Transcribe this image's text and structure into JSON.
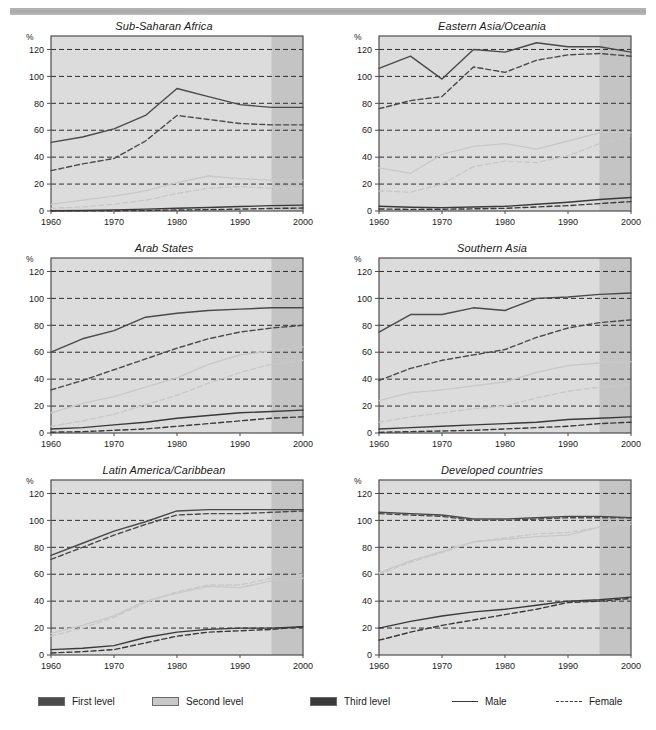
{
  "figure": {
    "y_axis_unit": "%",
    "y_ticks": [
      0,
      20,
      40,
      60,
      80,
      100,
      120
    ],
    "x_ticks": [
      1960,
      1970,
      1980,
      1990,
      2000
    ],
    "x_range": [
      1960,
      2000
    ],
    "y_range": [
      0,
      130
    ],
    "projection_start": 1995
  },
  "colors": {
    "first_level": "#4a4a4a",
    "second_level": "#c8c8c8",
    "third_level": "#3a3a3a",
    "plot_background": "#dcdcdc",
    "projection_background": "#c4c4c4",
    "gridline": "#2d2d2d",
    "axis": "#4d4d4d",
    "top_rule": "#b0b0b0"
  },
  "legend": {
    "items": [
      {
        "label": "First level",
        "type": "swatch",
        "color": "#4a4a4a"
      },
      {
        "label": "Second level",
        "type": "swatch",
        "color": "#c8c8c8"
      },
      {
        "label": "Third level",
        "type": "swatch",
        "color": "#3a3a3a"
      },
      {
        "label": "Male",
        "type": "line-solid"
      },
      {
        "label": "Female",
        "type": "line-dashed"
      }
    ]
  },
  "chart_data": [
    {
      "type": "line",
      "title": "Sub-Saharan Africa",
      "xlabel": "",
      "ylabel": "%",
      "xlim": [
        1960,
        2000
      ],
      "ylim": [
        0,
        130
      ],
      "xticks": [
        1960,
        1970,
        1980,
        1990,
        2000
      ],
      "yticks": [
        0,
        20,
        40,
        60,
        80,
        100,
        120
      ],
      "grid": true,
      "legend_position": "figure-bottom",
      "x": [
        1960,
        1965,
        1970,
        1975,
        1980,
        1985,
        1990,
        1995,
        2000
      ],
      "series": [
        {
          "name": "First level Male",
          "level": "first",
          "sex": "male",
          "style": "solid",
          "values": [
            51,
            55,
            61,
            71,
            91,
            85,
            79,
            77,
            77
          ]
        },
        {
          "name": "First level Female",
          "level": "first",
          "sex": "female",
          "style": "dashed",
          "values": [
            30,
            35,
            39,
            52,
            71,
            68,
            65,
            64,
            64
          ]
        },
        {
          "name": "Second level Male",
          "level": "second",
          "sex": "male",
          "style": "solid",
          "values": [
            5,
            8,
            11,
            15,
            21,
            26,
            24,
            23,
            23
          ]
        },
        {
          "name": "Second level Female",
          "level": "second",
          "sex": "female",
          "style": "dashed",
          "values": [
            2,
            3,
            5,
            8,
            13,
            17,
            18,
            17,
            17
          ]
        },
        {
          "name": "Third level Male",
          "level": "third",
          "sex": "male",
          "style": "solid",
          "values": [
            0.2,
            0.4,
            0.8,
            1.4,
            2.0,
            2.6,
            3.3,
            4.0,
            4.4
          ]
        },
        {
          "name": "Third level Female",
          "level": "third",
          "sex": "female",
          "style": "dashed",
          "values": [
            0.1,
            0.1,
            0.2,
            0.4,
            0.7,
            1.0,
            1.4,
            1.9,
            2.2
          ]
        }
      ]
    },
    {
      "type": "line",
      "title": "Eastern Asia/Oceania",
      "xlabel": "",
      "ylabel": "%",
      "xlim": [
        1960,
        2000
      ],
      "ylim": [
        0,
        130
      ],
      "xticks": [
        1960,
        1970,
        1980,
        1990,
        2000
      ],
      "yticks": [
        0,
        20,
        40,
        60,
        80,
        100,
        120
      ],
      "grid": true,
      "legend_position": "figure-bottom",
      "x": [
        1960,
        1965,
        1970,
        1975,
        1980,
        1985,
        1990,
        1995,
        2000
      ],
      "series": [
        {
          "name": "First level Male",
          "level": "first",
          "sex": "male",
          "style": "solid",
          "values": [
            106,
            115,
            98,
            120,
            118,
            125,
            122,
            122,
            118
          ]
        },
        {
          "name": "First level Female",
          "level": "first",
          "sex": "female",
          "style": "dashed",
          "values": [
            76,
            82,
            85,
            107,
            103,
            112,
            116,
            117,
            115
          ]
        },
        {
          "name": "Second level Male",
          "level": "second",
          "sex": "male",
          "style": "solid",
          "values": [
            32,
            28,
            42,
            48,
            50,
            46,
            52,
            58,
            58
          ]
        },
        {
          "name": "Second level Female",
          "level": "second",
          "sex": "female",
          "style": "dashed",
          "values": [
            15,
            14,
            20,
            33,
            37,
            36,
            41,
            50,
            56
          ]
        },
        {
          "name": "Third level Male",
          "level": "third",
          "sex": "male",
          "style": "solid",
          "values": [
            3.5,
            2.8,
            2.5,
            3.0,
            3.5,
            5.0,
            6.5,
            8.5,
            10.0
          ]
        },
        {
          "name": "Third level Female",
          "level": "third",
          "sex": "female",
          "style": "dashed",
          "values": [
            1.5,
            1.2,
            1.3,
            1.6,
            2.0,
            3.0,
            4.0,
            5.5,
            7.0
          ]
        }
      ]
    },
    {
      "type": "line",
      "title": "Arab States",
      "xlabel": "",
      "ylabel": "%",
      "xlim": [
        1960,
        2000
      ],
      "ylim": [
        0,
        130
      ],
      "xticks": [
        1960,
        1970,
        1980,
        1990,
        2000
      ],
      "yticks": [
        0,
        20,
        40,
        60,
        80,
        100,
        120
      ],
      "grid": true,
      "legend_position": "figure-bottom",
      "x": [
        1960,
        1965,
        1970,
        1975,
        1980,
        1985,
        1990,
        1995,
        2000
      ],
      "series": [
        {
          "name": "First level Male",
          "level": "first",
          "sex": "male",
          "style": "solid",
          "values": [
            60,
            70,
            76,
            86,
            89,
            91,
            92,
            93,
            93
          ]
        },
        {
          "name": "First level Female",
          "level": "first",
          "sex": "female",
          "style": "dashed",
          "values": [
            32,
            39,
            47,
            55,
            63,
            70,
            75,
            78,
            80
          ]
        },
        {
          "name": "Second level Male",
          "level": "second",
          "sex": "male",
          "style": "solid",
          "values": [
            15,
            22,
            27,
            34,
            41,
            51,
            58,
            61,
            64
          ]
        },
        {
          "name": "Second level Female",
          "level": "second",
          "sex": "female",
          "style": "dashed",
          "values": [
            5,
            9,
            14,
            21,
            28,
            37,
            45,
            51,
            54
          ]
        },
        {
          "name": "Third level Male",
          "level": "third",
          "sex": "male",
          "style": "solid",
          "values": [
            3,
            4,
            6,
            8,
            11,
            13,
            15,
            16,
            17
          ]
        },
        {
          "name": "Third level Female",
          "level": "third",
          "sex": "female",
          "style": "dashed",
          "values": [
            0.6,
            1,
            2,
            3,
            5,
            7,
            9,
            11,
            12
          ]
        }
      ]
    },
    {
      "type": "line",
      "title": "Southern Asia",
      "xlabel": "",
      "ylabel": "%",
      "xlim": [
        1960,
        2000
      ],
      "ylim": [
        0,
        130
      ],
      "xticks": [
        1960,
        1970,
        1980,
        1990,
        2000
      ],
      "yticks": [
        0,
        20,
        40,
        60,
        80,
        100,
        120
      ],
      "grid": true,
      "legend_position": "figure-bottom",
      "x": [
        1960,
        1965,
        1970,
        1975,
        1980,
        1985,
        1990,
        1995,
        2000
      ],
      "series": [
        {
          "name": "First level Male",
          "level": "first",
          "sex": "male",
          "style": "solid",
          "values": [
            75,
            88,
            88,
            93,
            91,
            100,
            101,
            103,
            104
          ]
        },
        {
          "name": "First level Female",
          "level": "first",
          "sex": "female",
          "style": "dashed",
          "values": [
            39,
            48,
            54,
            58,
            62,
            71,
            78,
            82,
            84
          ]
        },
        {
          "name": "Second level Male",
          "level": "second",
          "sex": "male",
          "style": "solid",
          "values": [
            24,
            30,
            32,
            35,
            38,
            45,
            50,
            52,
            53
          ]
        },
        {
          "name": "Second level Female",
          "level": "second",
          "sex": "female",
          "style": "dashed",
          "values": [
            8,
            12,
            15,
            18,
            20,
            26,
            31,
            34,
            36
          ]
        },
        {
          "name": "Third level Male",
          "level": "third",
          "sex": "male",
          "style": "solid",
          "values": [
            3,
            4,
            5,
            6,
            7,
            8,
            10,
            11,
            12
          ]
        },
        {
          "name": "Third level Female",
          "level": "third",
          "sex": "female",
          "style": "dashed",
          "values": [
            0.5,
            1,
            1.5,
            2,
            3,
            4,
            5,
            7,
            8
          ]
        }
      ]
    },
    {
      "type": "line",
      "title": "Latin America/Caribbean",
      "xlabel": "",
      "ylabel": "%",
      "xlim": [
        1960,
        2000
      ],
      "ylim": [
        0,
        130
      ],
      "xticks": [
        1960,
        1970,
        1980,
        1990,
        2000
      ],
      "yticks": [
        0,
        20,
        40,
        60,
        80,
        100,
        120
      ],
      "grid": true,
      "legend_position": "figure-bottom",
      "x": [
        1960,
        1965,
        1970,
        1975,
        1980,
        1985,
        1990,
        1995,
        2000
      ],
      "series": [
        {
          "name": "First level Male",
          "level": "first",
          "sex": "male",
          "style": "solid",
          "values": [
            74,
            83,
            92,
            99,
            107,
            108,
            108,
            108,
            108
          ]
        },
        {
          "name": "First level Female",
          "level": "first",
          "sex": "female",
          "style": "dashed",
          "values": [
            71,
            80,
            89,
            97,
            104,
            105,
            105,
            106,
            107
          ]
        },
        {
          "name": "Second level Male",
          "level": "second",
          "sex": "male",
          "style": "solid",
          "values": [
            16,
            22,
            29,
            40,
            46,
            51,
            50,
            55,
            57
          ]
        },
        {
          "name": "Second level Female",
          "level": "second",
          "sex": "female",
          "style": "dashed",
          "values": [
            14,
            20,
            28,
            39,
            47,
            52,
            52,
            57,
            60
          ]
        },
        {
          "name": "Third level Male",
          "level": "third",
          "sex": "male",
          "style": "solid",
          "values": [
            4,
            5,
            7,
            13,
            17,
            19,
            20,
            20,
            21
          ]
        },
        {
          "name": "Third level Female",
          "level": "third",
          "sex": "female",
          "style": "dashed",
          "values": [
            1.5,
            2.5,
            4,
            9,
            14,
            17,
            18,
            19,
            21
          ]
        }
      ]
    },
    {
      "type": "line",
      "title": "Developed countries",
      "xlabel": "",
      "ylabel": "%",
      "xlim": [
        1960,
        2000
      ],
      "ylim": [
        0,
        130
      ],
      "xticks": [
        1960,
        1970,
        1980,
        1990,
        2000
      ],
      "yticks": [
        0,
        20,
        40,
        60,
        80,
        100,
        120
      ],
      "grid": true,
      "legend_position": "figure-bottom",
      "x": [
        1960,
        1965,
        1970,
        1975,
        1980,
        1985,
        1990,
        1995,
        2000
      ],
      "series": [
        {
          "name": "First level Male",
          "level": "first",
          "sex": "male",
          "style": "solid",
          "values": [
            106,
            105,
            104,
            101,
            101,
            102,
            103,
            103,
            102
          ]
        },
        {
          "name": "First level Female",
          "level": "first",
          "sex": "female",
          "style": "dashed",
          "values": [
            105,
            104,
            103,
            100,
            100,
            101,
            102,
            102,
            102
          ]
        },
        {
          "name": "Second level Male",
          "level": "second",
          "sex": "male",
          "style": "solid",
          "values": [
            61,
            70,
            77,
            84,
            86,
            88,
            89,
            95,
            99
          ]
        },
        {
          "name": "Second level Female",
          "level": "second",
          "sex": "female",
          "style": "dashed",
          "values": [
            60,
            69,
            76,
            84,
            87,
            90,
            91,
            95,
            97
          ]
        },
        {
          "name": "Third level Male",
          "level": "third",
          "sex": "male",
          "style": "solid",
          "values": [
            20,
            25,
            29,
            32,
            34,
            37,
            40,
            41,
            43
          ]
        },
        {
          "name": "Third level Female",
          "level": "third",
          "sex": "female",
          "style": "dashed",
          "values": [
            11,
            17,
            22,
            26,
            30,
            34,
            39,
            40,
            42
          ]
        }
      ]
    }
  ]
}
